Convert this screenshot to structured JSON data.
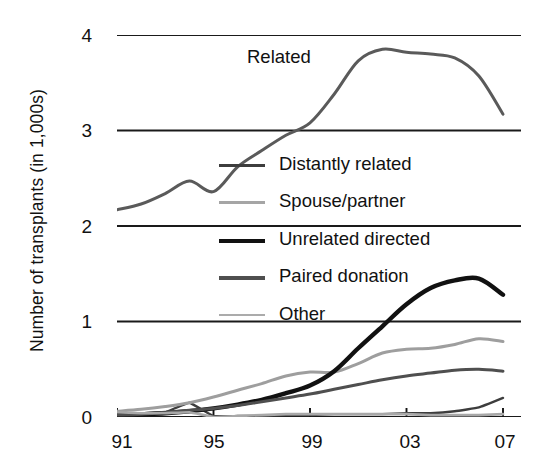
{
  "chart_data": {
    "type": "line",
    "title": "",
    "xlabel": "",
    "ylabel": "Number of transplants (in 1,000s)",
    "x": [
      1991,
      1992,
      1993,
      1994,
      1995,
      1996,
      1997,
      1998,
      1999,
      2000,
      2001,
      2002,
      2003,
      2004,
      2005,
      2006,
      2007
    ],
    "xtick_labels": [
      "91",
      "95",
      "99",
      "03",
      "07"
    ],
    "xtick_values": [
      1991,
      1995,
      1999,
      2003,
      2007
    ],
    "xlim": [
      1991,
      2007
    ],
    "ytick_labels": [
      "0",
      "1",
      "2",
      "3",
      "4"
    ],
    "ytick_values": [
      0,
      1,
      2,
      3,
      4
    ],
    "ylim": [
      0,
      4
    ],
    "grid": "horizontal",
    "legend_position": "center",
    "annotations": [
      {
        "text": "Related",
        "x": 1998.4,
        "y": 3.62
      }
    ],
    "series": [
      {
        "name": "Related",
        "color": "#5a5a5a",
        "width": 3.0,
        "in_legend": false,
        "values": [
          2.17,
          2.23,
          2.34,
          2.47,
          2.36,
          2.62,
          2.79,
          2.95,
          3.08,
          3.38,
          3.73,
          3.85,
          3.82,
          3.8,
          3.76,
          3.57,
          3.17
        ]
      },
      {
        "name": "Distantly related",
        "color": "#3d3d3d",
        "width": 2.4,
        "in_legend": true,
        "values": [
          0.03,
          0.04,
          0.05,
          0.15,
          0.01,
          0.01,
          0.01,
          0.02,
          0.02,
          0.03,
          0.03,
          0.03,
          0.04,
          0.04,
          0.06,
          0.1,
          0.2
        ]
      },
      {
        "name": "Spouse/partner",
        "color": "#9e9e9e",
        "width": 3.0,
        "in_legend": true,
        "values": [
          0.06,
          0.08,
          0.11,
          0.15,
          0.21,
          0.28,
          0.35,
          0.43,
          0.47,
          0.47,
          0.56,
          0.67,
          0.71,
          0.72,
          0.76,
          0.82,
          0.79
        ]
      },
      {
        "name": "Unrelated directed",
        "color": "#111111",
        "width": 4.4,
        "in_legend": true,
        "values": [
          0.02,
          0.03,
          0.04,
          0.06,
          0.09,
          0.13,
          0.18,
          0.25,
          0.33,
          0.48,
          0.72,
          0.95,
          1.18,
          1.35,
          1.43,
          1.45,
          1.28
        ]
      },
      {
        "name": "Paired donation",
        "color": "#4f4f4f",
        "width": 3.0,
        "in_legend": true,
        "values": [
          0.02,
          0.03,
          0.05,
          0.07,
          0.09,
          0.12,
          0.16,
          0.2,
          0.24,
          0.29,
          0.34,
          0.39,
          0.43,
          0.46,
          0.49,
          0.5,
          0.48
        ]
      },
      {
        "name": "Other",
        "color": "#a8a8a8",
        "width": 2.6,
        "in_legend": true,
        "values": [
          0.05,
          0.04,
          0.04,
          0.05,
          0.0,
          0.01,
          0.02,
          0.03,
          0.03,
          0.03,
          0.03,
          0.03,
          0.03,
          0.02,
          0.02,
          0.02,
          0.03
        ]
      }
    ]
  },
  "axis": {
    "y_title": "Number of transplants (in 1,000s)",
    "y_ticks": [
      "4",
      "3",
      "2",
      "1",
      "0"
    ],
    "x_ticks": [
      "91",
      "95",
      "99",
      "03",
      "07"
    ]
  },
  "legend": {
    "items": [
      {
        "label": "Distantly related",
        "color": "#3d3d3d",
        "thickness": "2.8px"
      },
      {
        "label": "Spouse/partner",
        "color": "#a5a5a5",
        "thickness": "2.8px"
      },
      {
        "label": "Unrelated directed",
        "color": "#111111",
        "thickness": "4.6px"
      },
      {
        "label": "Paired donation",
        "color": "#4f4f4f",
        "thickness": "3.4px"
      },
      {
        "label": "Other",
        "color": "#ababab",
        "thickness": "2.4px"
      }
    ]
  },
  "annotation": {
    "related": "Related"
  },
  "colors": {
    "axis": "#111111",
    "grid": "#1a1a1a",
    "background": "#ffffff"
  }
}
